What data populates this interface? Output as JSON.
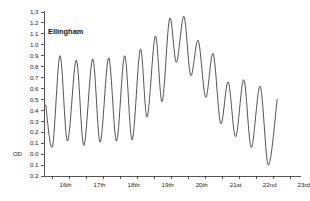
{
  "chart_data": {
    "type": "line",
    "title": "Ellingham",
    "xlabel": "",
    "ylabel": "OD",
    "datum_label": "OD",
    "ylim": [
      -0.2,
      1.3
    ],
    "xlim": [
      15.75,
      23.3
    ],
    "grid": false,
    "legend": false,
    "line_color": "#1a1a1a",
    "y_ticks": [
      {
        "value": 1.3,
        "label": "1.3"
      },
      {
        "value": 1.2,
        "label": "1.2"
      },
      {
        "value": 1.1,
        "label": "1.1"
      },
      {
        "value": 1.0,
        "label": "1.0"
      },
      {
        "value": 0.9,
        "label": "0.9"
      },
      {
        "value": 0.8,
        "label": "0.8"
      },
      {
        "value": 0.7,
        "label": "0.7"
      },
      {
        "value": 0.6,
        "label": "0.6"
      },
      {
        "value": 0.5,
        "label": "0.5"
      },
      {
        "value": 0.4,
        "label": "0.4"
      },
      {
        "value": 0.3,
        "label": "0.3"
      },
      {
        "value": 0.2,
        "label": "0.2"
      },
      {
        "value": 0.1,
        "label": "0.1"
      },
      {
        "value": 0.0,
        "label": "0.0"
      },
      {
        "value": -0.1,
        "label": "0.1"
      },
      {
        "value": -0.2,
        "label": "0.2"
      }
    ],
    "x_ticks": [
      {
        "value": 16,
        "label": "16th"
      },
      {
        "value": 17,
        "label": "17th"
      },
      {
        "value": 18,
        "label": "18th"
      },
      {
        "value": 19,
        "label": "19th"
      },
      {
        "value": 20,
        "label": "20th"
      },
      {
        "value": 21,
        "label": "21st"
      },
      {
        "value": 22,
        "label": "22nd"
      },
      {
        "value": 23,
        "label": "23rd"
      }
    ],
    "x_minor_ticks": [
      16.5,
      17.5,
      18.5,
      19.5,
      20.5,
      21.5,
      22.5
    ],
    "series": [
      {
        "name": "Ellingham",
        "points": [
          [
            15.8,
            0.45
          ],
          [
            16.0,
            0.07
          ],
          [
            16.22,
            0.9
          ],
          [
            16.44,
            0.12
          ],
          [
            16.7,
            0.86
          ],
          [
            16.92,
            0.08
          ],
          [
            17.18,
            0.87
          ],
          [
            17.4,
            0.11
          ],
          [
            17.65,
            0.88
          ],
          [
            17.88,
            0.12
          ],
          [
            18.12,
            0.9
          ],
          [
            18.34,
            0.13
          ],
          [
            18.58,
            0.96
          ],
          [
            18.78,
            0.34
          ],
          [
            19.02,
            1.08
          ],
          [
            19.22,
            0.48
          ],
          [
            19.44,
            1.24
          ],
          [
            19.64,
            0.84
          ],
          [
            19.86,
            1.26
          ],
          [
            20.06,
            0.72
          ],
          [
            20.28,
            1.04
          ],
          [
            20.5,
            0.52
          ],
          [
            20.72,
            0.92
          ],
          [
            20.94,
            0.28
          ],
          [
            21.16,
            0.66
          ],
          [
            21.38,
            0.16
          ],
          [
            21.62,
            0.68
          ],
          [
            21.84,
            0.06
          ],
          [
            22.1,
            0.62
          ],
          [
            22.34,
            -0.1
          ],
          [
            22.6,
            0.5
          ]
        ]
      }
    ]
  }
}
